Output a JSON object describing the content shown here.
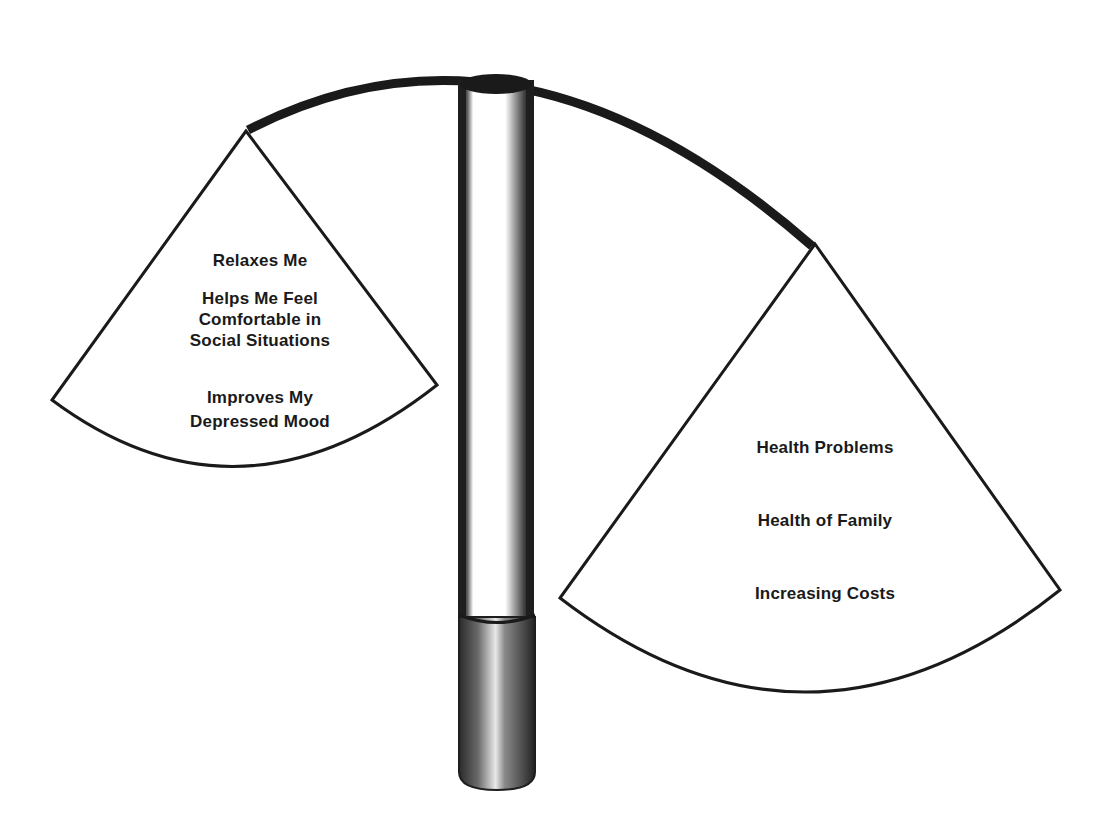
{
  "diagram": {
    "type": "balance-scale",
    "beam_icon": "cigarette-icon",
    "left_pan": {
      "name": "pros-of-smoking",
      "items": [
        "Relaxes Me",
        "Helps Me Feel",
        "Comfortable in",
        "Social Situations",
        "Improves My",
        "Depressed Mood"
      ]
    },
    "right_pan": {
      "name": "cons-of-smoking",
      "items": [
        "Health Problems",
        "Health of Family",
        "Increasing Costs"
      ]
    },
    "colors": {
      "ink": "#1a1a1a",
      "background": "#ffffff",
      "cigarette_paper": "#ffffff",
      "filter": "#6e6e6e"
    }
  }
}
